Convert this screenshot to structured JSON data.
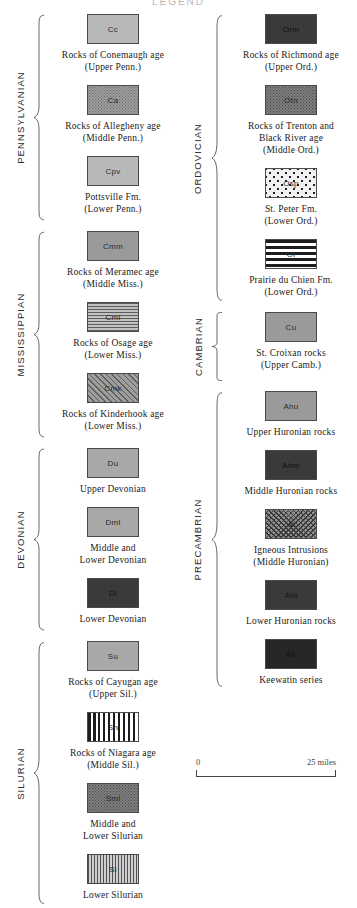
{
  "title": "LEGEND",
  "scale": {
    "left_label": "0",
    "right_label": "25 miles"
  },
  "columns": [
    {
      "name": "left",
      "groups": [
        {
          "period": "PENNSYLVANIAN",
          "entries": [
            {
              "code": "Cc",
              "pattern": "solid-light",
              "caption": [
                "Rocks of Conemaugh age",
                "(Upper Penn.)"
              ]
            },
            {
              "code": "Ca",
              "pattern": "stipple",
              "caption": [
                "Rocks of Allegheny age",
                "(Middle Penn.)"
              ]
            },
            {
              "code": "Cpv",
              "pattern": "solid-light",
              "caption": [
                "Pottsville Fm.",
                "(Lower Penn.)"
              ]
            }
          ]
        },
        {
          "period": "MISSISSIPPIAN",
          "entries": [
            {
              "code": "Cmm",
              "pattern": "solid-mid",
              "caption": [
                "Rocks of Meramec age",
                "(Middle Miss.)"
              ]
            },
            {
              "code": "Cml",
              "pattern": "hlines-fine",
              "caption": [
                "Rocks of Osage age",
                "(Lower Miss.)"
              ]
            },
            {
              "code": "Cmk",
              "pattern": "diag",
              "caption": [
                "Rocks of Kinderhook age",
                "(Lower Miss.)"
              ]
            }
          ]
        },
        {
          "period": "DEVONIAN",
          "entries": [
            {
              "code": "Du",
              "pattern": "solid-gray",
              "caption": [
                "Upper Devonian"
              ]
            },
            {
              "code": "Dml",
              "pattern": "solid-gray",
              "caption": [
                "Middle and",
                "Lower Devonian"
              ]
            },
            {
              "code": "Dl",
              "pattern": "solid-dark",
              "caption": [
                "Lower Devonian"
              ]
            }
          ]
        },
        {
          "period": "SILURIAN",
          "entries": [
            {
              "code": "Su",
              "pattern": "solid-gray",
              "caption": [
                "Rocks of Cayugan age",
                "(Upper Sil.)"
              ]
            },
            {
              "code": "Sn",
              "pattern": "vlines-bold",
              "caption": [
                "Rocks of Niagara age",
                "(Middle Sil.)"
              ]
            },
            {
              "code": "Sml",
              "pattern": "stipple-dark",
              "caption": [
                "Middle and",
                "Lower Silurian"
              ]
            },
            {
              "code": "Sl",
              "pattern": "vlines-fine",
              "caption": [
                "Lower Silurian"
              ]
            }
          ]
        }
      ]
    },
    {
      "name": "right",
      "groups": [
        {
          "period": "ORDOVICIAN",
          "entries": [
            {
              "code": "Orm",
              "pattern": "solid-dark",
              "caption": [
                "Rocks of Richmond age",
                "(Upper Ord.)"
              ]
            },
            {
              "code": "Otn",
              "pattern": "stipple-dark",
              "caption": [
                "Rocks of Trenton and",
                "Black River age",
                "(Middle Ord.)"
              ]
            },
            {
              "code": "Osp",
              "pattern": "dots-sparse",
              "caption": [
                "St. Peter Fm.",
                "(Lower Ord.)"
              ]
            },
            {
              "code": "Ol",
              "pattern": "hlines-bold",
              "caption": [
                "Prairie du Chien Fm.",
                "(Lower Ord.)"
              ]
            }
          ]
        },
        {
          "period": "CAMBRIAN",
          "entries": [
            {
              "code": "Cu",
              "pattern": "solid-mid",
              "caption": [
                "St. Croixan rocks",
                "(Upper Camb.)"
              ]
            }
          ]
        },
        {
          "period": "PRECAMBRIAN",
          "entries": [
            {
              "code": "Ahu",
              "pattern": "solid-mid",
              "caption": [
                "Upper Huronian rocks"
              ]
            },
            {
              "code": "Ahm",
              "pattern": "solid-dark",
              "caption": [
                "Middle Huronian rocks"
              ]
            },
            {
              "code": "Ai",
              "pattern": "crosshatch",
              "caption": [
                "Igneous Intrusions",
                "(Middle Huronian)"
              ]
            },
            {
              "code": "Ahl",
              "pattern": "solid-dark",
              "caption": [
                "Lower Huronian rocks"
              ]
            },
            {
              "code": "Ak",
              "pattern": "solid-black",
              "caption": [
                "Keewatin series"
              ]
            }
          ]
        }
      ]
    }
  ]
}
